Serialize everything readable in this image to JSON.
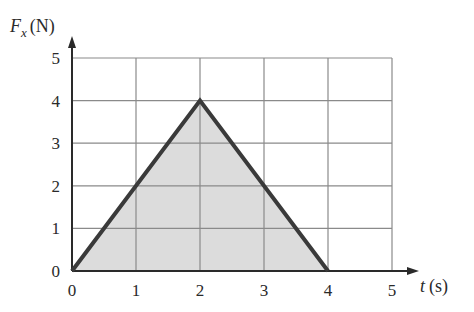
{
  "chart_data": {
    "type": "area",
    "title": "",
    "xlabel": "t (s)",
    "ylabel": "F_x (N)",
    "x_label_var": "t",
    "x_label_unit": "(s)",
    "y_label_var": "F",
    "y_label_sub": "x",
    "y_label_unit": "(N)",
    "x": [
      0,
      2,
      4
    ],
    "series": [
      {
        "name": "F_x",
        "values": [
          0,
          4,
          0
        ]
      }
    ],
    "xlim": [
      0,
      5
    ],
    "ylim": [
      0,
      5
    ],
    "xticks": [
      "0",
      "1",
      "2",
      "3",
      "4",
      "5"
    ],
    "yticks": [
      "0",
      "1",
      "2",
      "3",
      "4",
      "5"
    ],
    "grid": true,
    "fill_under_curve": true,
    "legend": null
  },
  "colors": {
    "line": "#3a3a3a",
    "fill": "#dcdcdc",
    "grid": "#8a8a8a",
    "axis": "#2a2a2a"
  }
}
